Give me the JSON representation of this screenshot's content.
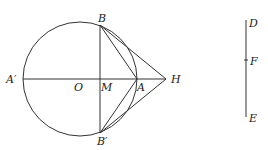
{
  "diagram": {
    "type": "geometry",
    "figure_left": {
      "circle": {
        "cx": 80,
        "cy": 79,
        "r": 57
      },
      "points": {
        "A_prime": {
          "label": "A′",
          "x": 23,
          "y": 79
        },
        "O": {
          "label": "O",
          "x": 80,
          "y": 79
        },
        "M": {
          "label": "M",
          "x": 100,
          "y": 79
        },
        "A": {
          "label": "A",
          "x": 137,
          "y": 79
        },
        "H": {
          "label": "H",
          "x": 166,
          "y": 79
        },
        "B": {
          "label": "B",
          "x": 100,
          "y": 25
        },
        "B_prime": {
          "label": "B′",
          "x": 100,
          "y": 133
        }
      },
      "segments": [
        [
          "A′",
          "H"
        ],
        [
          "B",
          "B′"
        ],
        [
          "B",
          "A"
        ],
        [
          "B′",
          "A"
        ],
        [
          "B",
          "H"
        ],
        [
          "B′",
          "H"
        ]
      ]
    },
    "figure_right": {
      "points": {
        "D": {
          "label": "D",
          "x": 246,
          "y": 20
        },
        "F": {
          "label": "F",
          "x": 246,
          "y": 60
        },
        "E": {
          "label": "E",
          "x": 246,
          "y": 117
        }
      },
      "segments": [
        [
          "D",
          "E"
        ]
      ]
    }
  }
}
